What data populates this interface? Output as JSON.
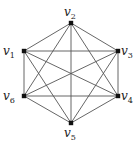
{
  "diagram": {
    "type": "graph",
    "name": "complete-graph-K6",
    "colors": {
      "edge": "#555555",
      "node": "#111111",
      "label": "#222222"
    },
    "vertices": [
      {
        "id": "v1",
        "base": "v",
        "sub": "1",
        "x": 24,
        "y": 51,
        "lx": 3,
        "ly": 55,
        "anchor": "start"
      },
      {
        "id": "v2",
        "base": "v",
        "sub": "2",
        "x": 71,
        "y": 23,
        "lx": 64,
        "ly": 16,
        "anchor": "start"
      },
      {
        "id": "v3",
        "base": "v",
        "sub": "3",
        "x": 118,
        "y": 51,
        "lx": 121,
        "ly": 55,
        "anchor": "start"
      },
      {
        "id": "v4",
        "base": "v",
        "sub": "4",
        "x": 118,
        "y": 96,
        "lx": 121,
        "ly": 100,
        "anchor": "start"
      },
      {
        "id": "v5",
        "base": "v",
        "sub": "5",
        "x": 71,
        "y": 123,
        "lx": 64,
        "ly": 137,
        "anchor": "start"
      },
      {
        "id": "v6",
        "base": "v",
        "sub": "6",
        "x": 24,
        "y": 96,
        "lx": 3,
        "ly": 100,
        "anchor": "start"
      }
    ],
    "edges": [
      [
        "v1",
        "v2"
      ],
      [
        "v1",
        "v3"
      ],
      [
        "v1",
        "v4"
      ],
      [
        "v1",
        "v5"
      ],
      [
        "v1",
        "v6"
      ],
      [
        "v2",
        "v3"
      ],
      [
        "v2",
        "v4"
      ],
      [
        "v2",
        "v5"
      ],
      [
        "v2",
        "v6"
      ],
      [
        "v3",
        "v4"
      ],
      [
        "v3",
        "v5"
      ],
      [
        "v3",
        "v6"
      ],
      [
        "v4",
        "v5"
      ],
      [
        "v4",
        "v6"
      ],
      [
        "v5",
        "v6"
      ]
    ]
  }
}
